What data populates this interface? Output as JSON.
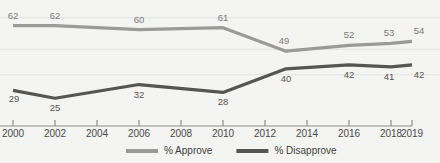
{
  "chart_data": {
    "type": "line",
    "title": "",
    "xlabel": "",
    "ylabel": "",
    "grid": true,
    "legend_position": "bottom",
    "ylim": [
      18,
      70
    ],
    "x": [
      2000,
      2002,
      2004,
      2006,
      2008,
      2010,
      2012,
      2013,
      2014,
      2016,
      2018,
      2019
    ],
    "categories": [
      "2000",
      "2002",
      "2004",
      "2006",
      "2008",
      "2010",
      "2012",
      "2014",
      "2016",
      "2018",
      "2019"
    ],
    "tick_labels": [
      "2000",
      "2002",
      "2004",
      "2006",
      "2008",
      "2010",
      "2012",
      "2014",
      "2016",
      "2018",
      "2019"
    ],
    "series": [
      {
        "name": "% Approve",
        "color": "#9a9a9a",
        "points": [
          {
            "x": 2000,
            "y": 62,
            "label": "62"
          },
          {
            "x": 2002,
            "y": 62,
            "label": "62"
          },
          {
            "x": 2006,
            "y": 60,
            "label": "60"
          },
          {
            "x": 2010,
            "y": 61,
            "label": "61"
          },
          {
            "x": 2013,
            "y": 49,
            "label": "49"
          },
          {
            "x": 2016,
            "y": 52,
            "label": "52"
          },
          {
            "x": 2018,
            "y": 53,
            "label": "53"
          },
          {
            "x": 2019,
            "y": 54,
            "label": "54"
          }
        ]
      },
      {
        "name": "% Disapprove",
        "color": "#555555",
        "points": [
          {
            "x": 2000,
            "y": 29,
            "label": "29"
          },
          {
            "x": 2002,
            "y": 25,
            "label": "25"
          },
          {
            "x": 2006,
            "y": 32,
            "label": "32"
          },
          {
            "x": 2010,
            "y": 28,
            "label": "28"
          },
          {
            "x": 2013,
            "y": 40,
            "label": "40"
          },
          {
            "x": 2016,
            "y": 42,
            "label": "42"
          },
          {
            "x": 2018,
            "y": 41,
            "label": "41"
          },
          {
            "x": 2019,
            "y": 42,
            "label": "42"
          }
        ]
      }
    ]
  },
  "legend": {
    "items": [
      {
        "label": "% Approve",
        "color": "#9a9a9a"
      },
      {
        "label": "% Disapprove",
        "color": "#555555"
      }
    ]
  },
  "colors": {
    "background": "#f4f4f2",
    "approve": "#9a9a9a",
    "disapprove": "#555555",
    "grid": "#e2e2e0",
    "axis": "#8c8c8c",
    "label_light": "#7a7a7a",
    "label_dark": "#555555",
    "tick_text": "#4a4a4a"
  }
}
